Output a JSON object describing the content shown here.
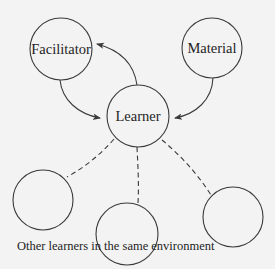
{
  "diagram": {
    "nodes": [
      {
        "id": "facilitator",
        "label": "Facilitator",
        "cx": 61,
        "cy": 49,
        "r": 31
      },
      {
        "id": "material",
        "label": "Material",
        "cx": 212,
        "cy": 48,
        "r": 30
      },
      {
        "id": "learner",
        "label": "Learner",
        "cx": 138,
        "cy": 116,
        "r": 31
      },
      {
        "id": "other-learner-1",
        "label": "",
        "cx": 43,
        "cy": 200,
        "r": 30
      },
      {
        "id": "other-learner-2",
        "label": "",
        "cx": 127,
        "cy": 234,
        "r": 31
      },
      {
        "id": "other-learner-3",
        "label": "",
        "cx": 233,
        "cy": 217,
        "r": 30
      }
    ],
    "edges": [
      {
        "from": "learner",
        "to": "facilitator",
        "style": "solid-arrow"
      },
      {
        "from": "facilitator",
        "to": "learner",
        "style": "solid-arrow"
      },
      {
        "from": "material",
        "to": "learner",
        "style": "solid-arrow"
      },
      {
        "from": "learner",
        "to": "other-learner-1",
        "style": "dashed"
      },
      {
        "from": "learner",
        "to": "other-learner-2",
        "style": "dashed"
      },
      {
        "from": "learner",
        "to": "other-learner-3",
        "style": "dashed"
      }
    ],
    "caption": "Other learners in the same environment",
    "colors": {
      "background": "#f3f3f3",
      "stroke": "#3a3a3a",
      "text": "#1e1e1e"
    }
  }
}
